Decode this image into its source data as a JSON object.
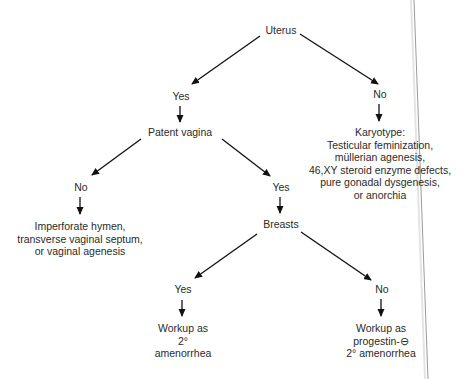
{
  "diagram": {
    "type": "decision-tree",
    "nodes": {
      "uterus": {
        "label": "Uterus"
      },
      "uterus_yes": {
        "label": "Yes"
      },
      "uterus_no": {
        "label": "No"
      },
      "karyotype": {
        "lines": [
          "Karyotype:",
          "Testicular feminization,",
          "müllerian agenesis,",
          "46,XY steroid enzyme defects,",
          "pure gonadal dysgenesis,",
          "or anorchia"
        ]
      },
      "patent_vagina": {
        "label": "Patent vagina"
      },
      "vagina_no": {
        "label": "No"
      },
      "vagina_yes": {
        "label": "Yes"
      },
      "outflow": {
        "lines": [
          "Imperforate hymen,",
          "transverse vaginal septum,",
          "or vaginal agenesis"
        ]
      },
      "breasts": {
        "label": "Breasts"
      },
      "breasts_yes": {
        "label": "Yes"
      },
      "breasts_no": {
        "label": "No"
      },
      "workup_secondary": {
        "lines": [
          "Workup as",
          "2°",
          "amenorrhea"
        ]
      },
      "workup_progestin": {
        "lines": [
          "Workup as",
          "progestin-⊖",
          "2° amenorrhea"
        ]
      }
    },
    "edges": [
      {
        "from": "uterus",
        "to": "uterus_yes"
      },
      {
        "from": "uterus",
        "to": "uterus_no"
      },
      {
        "from": "uterus_no",
        "to": "karyotype"
      },
      {
        "from": "uterus_yes",
        "to": "patent_vagina"
      },
      {
        "from": "patent_vagina",
        "to": "vagina_no"
      },
      {
        "from": "patent_vagina",
        "to": "vagina_yes"
      },
      {
        "from": "vagina_no",
        "to": "outflow"
      },
      {
        "from": "vagina_yes",
        "to": "breasts"
      },
      {
        "from": "breasts",
        "to": "breasts_yes"
      },
      {
        "from": "breasts",
        "to": "breasts_no"
      },
      {
        "from": "breasts_yes",
        "to": "workup_secondary"
      },
      {
        "from": "breasts_no",
        "to": "workup_progestin"
      }
    ]
  }
}
